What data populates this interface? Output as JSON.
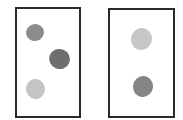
{
  "diagram": {
    "panels": [
      {
        "id": "left",
        "frame": {
          "x": 15,
          "y": 7,
          "w": 66,
          "h": 111,
          "border": "#2a2a2a"
        },
        "blobs": [
          {
            "x": 26,
            "y": 24,
            "w": 18,
            "h": 17,
            "rot": -10,
            "color": "#8c8c8c"
          },
          {
            "x": 49,
            "y": 49,
            "w": 21,
            "h": 20,
            "rot": 20,
            "color": "#6e6e6e"
          },
          {
            "x": 26,
            "y": 79,
            "w": 19,
            "h": 20,
            "rot": -15,
            "color": "#c4c4c4"
          }
        ]
      },
      {
        "id": "right",
        "frame": {
          "x": 108,
          "y": 8,
          "w": 67,
          "h": 110,
          "border": "#2a2a2a"
        },
        "blobs": [
          {
            "x": 131,
            "y": 28,
            "w": 21,
            "h": 22,
            "rot": 25,
            "color": "#c6c6c6"
          },
          {
            "x": 133,
            "y": 76,
            "w": 20,
            "h": 21,
            "rot": 25,
            "color": "#858585"
          }
        ]
      }
    ]
  }
}
